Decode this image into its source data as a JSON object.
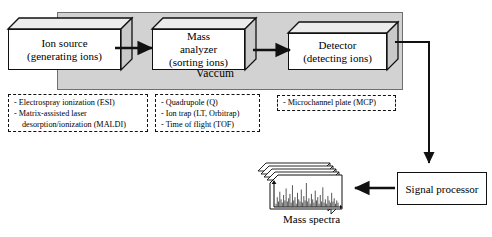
{
  "diagram": {
    "vacuum": {
      "label": "Vaccum"
    },
    "stages": [
      {
        "id": "ion-source",
        "line1": "Ion source",
        "line2": "(generating ions)"
      },
      {
        "id": "mass-analyzer",
        "line1": "Mass",
        "line2": "analyzer",
        "line3": "(sorting ions)"
      },
      {
        "id": "detector",
        "line1": "Detector",
        "line2": "(detecting ions)"
      }
    ],
    "annotations": [
      {
        "id": "ion-source-methods",
        "lines": [
          "- Electrospray ionization (ESI)",
          "- Matrix-assisted laser",
          "desorption/ionization (MALDI)"
        ],
        "indent": [
          false,
          false,
          true
        ]
      },
      {
        "id": "mass-analyzer-types",
        "lines": [
          "- Quadrupole (Q)",
          "- Ion trap (LT, Orbitrap)",
          "- Time of flight (TOF)"
        ],
        "indent": [
          false,
          false,
          false
        ]
      },
      {
        "id": "detector-types",
        "lines": [
          "- Microchannel plate (MCP)"
        ],
        "indent": [
          false
        ]
      }
    ],
    "signal_processor": {
      "label": "Signal processor"
    },
    "mass_spectra": {
      "caption": "Mass spectra",
      "sheet_count": 5,
      "peaks": [
        3,
        9,
        5,
        14,
        7,
        4,
        11,
        6,
        17,
        5,
        8,
        12,
        4,
        20,
        6,
        9,
        3,
        13,
        7,
        5,
        16,
        4,
        10,
        6,
        22,
        5,
        8,
        3,
        12,
        7,
        4,
        15,
        6,
        9,
        3,
        11,
        5,
        18,
        4,
        7,
        3,
        10,
        6,
        4,
        13,
        5,
        8,
        3,
        6,
        4
      ]
    },
    "colors": {
      "vacuum_fill": "#d2d2d2",
      "box_fill": "#ffffff",
      "face_shade": "#c9c9c9",
      "top_shade": "#ececec",
      "stroke": "#111111",
      "background": "#ffffff"
    }
  }
}
